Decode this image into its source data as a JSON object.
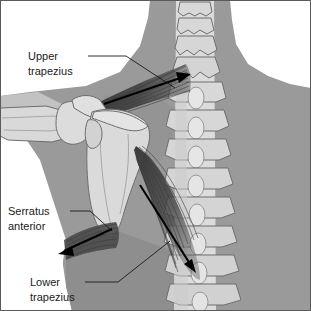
{
  "figure": {
    "width": 311,
    "height": 311,
    "background_color": "#ffffff"
  },
  "palette": {
    "background": "#ffffff",
    "torso_gray": "#9a9a9a",
    "torso_shadow": "#8a8a8a",
    "skin_light": "#c9c9c9",
    "bone_light": "#dcdcdc",
    "bone_mid": "#cfcfcf",
    "bone_outline": "#6e6e6e",
    "muscle_dark": "#3a3a3a",
    "muscle_mid": "#555555",
    "label_text": "#1a1a1a",
    "arrow_black": "#000000",
    "frame_border": "#5a5a5a"
  },
  "labels": [
    {
      "id": "upper-trapezius",
      "line1": "Upper",
      "line2": "trapezius",
      "text_x": 28,
      "text_y1": 57,
      "text_y2": 72,
      "leader": "M 88 56 L 126 56 L 175 88"
    },
    {
      "id": "serratus-anterior",
      "line1": "Serratus",
      "line2": "anterior",
      "text_x": 8,
      "text_y1": 212,
      "text_y2": 227,
      "leader": "M 70 211 L 90 211 L 112 231"
    },
    {
      "id": "lower-trapezius",
      "line1": "Lower",
      "line2": "trapezius",
      "text_x": 30,
      "text_y1": 283,
      "text_y2": 298,
      "leader": "M 85 282 L 118 282 L 170 241"
    }
  ],
  "muscles": [
    {
      "id": "upper-trapezius-muscle",
      "name": "Upper trapezius",
      "description": "Dark fan of fibers from acromion to cervical spine",
      "fiber_count": 14
    },
    {
      "id": "lower-trapezius-muscle",
      "name": "Lower trapezius",
      "description": "Dark fan of fibers from scapular spine to lower thoracic spine",
      "fiber_count": 16
    },
    {
      "id": "serratus-anterior-muscle",
      "name": "Serratus anterior",
      "description": "Dark band of fibers below inferior angle of scapula",
      "fiber_count": 8
    }
  ],
  "bones": [
    {
      "id": "cervical-spine",
      "name": "Cervical vertebrae",
      "count": 4
    },
    {
      "id": "thoracic-spine",
      "name": "Thoracic vertebrae",
      "count": 10
    },
    {
      "id": "scapula",
      "name": "Scapula"
    },
    {
      "id": "humerus",
      "name": "Humerus"
    },
    {
      "id": "clavicle",
      "name": "Clavicle / acromion"
    }
  ],
  "arrows": [
    {
      "id": "upper-trapezius-arrow",
      "from_x": 104,
      "from_y": 104,
      "to_x": 191,
      "to_y": 75,
      "direction": "up-right toward cervical spine"
    },
    {
      "id": "lower-trapezius-arrow",
      "from_x": 140,
      "from_y": 185,
      "to_x": 196,
      "to_y": 272,
      "direction": "down-right toward lower thoracic spine"
    },
    {
      "id": "serratus-anterior-arrow",
      "from_x": 110,
      "from_y": 230,
      "to_x": 59,
      "to_y": 254,
      "direction": "down-left away from scapula"
    }
  ]
}
